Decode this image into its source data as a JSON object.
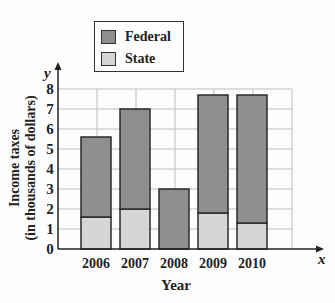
{
  "legend": {
    "items": [
      {
        "label": "Federal",
        "color": "#8f8f8f"
      },
      {
        "label": "State",
        "color": "#d6d6d6"
      }
    ]
  },
  "axes": {
    "y_symbol": "y",
    "x_symbol": "x",
    "ylabel_line1": "Income taxes",
    "ylabel_line2": "(in thousands of dollars)",
    "xlabel": "Year",
    "y_ticks": [
      "0",
      "1",
      "2",
      "3",
      "4",
      "5",
      "6",
      "7",
      "8"
    ]
  },
  "chart_data": {
    "type": "bar",
    "stacked": true,
    "title": "",
    "xlabel": "Year",
    "ylabel": "Income taxes (in thousands of dollars)",
    "categories": [
      "2006",
      "2007",
      "2008",
      "2009",
      "2010"
    ],
    "series": [
      {
        "name": "State",
        "color": "#d6d6d6",
        "values": [
          1.6,
          2.0,
          0.0,
          1.8,
          1.3
        ]
      },
      {
        "name": "Federal",
        "color": "#8f8f8f",
        "values": [
          4.0,
          5.0,
          3.0,
          5.9,
          6.4
        ]
      }
    ],
    "totals": [
      5.6,
      7.0,
      3.0,
      7.7,
      7.7
    ],
    "ylim": [
      0,
      8
    ],
    "y_ticks": [
      0,
      1,
      2,
      3,
      4,
      5,
      6,
      7,
      8
    ],
    "grid": true,
    "legend_position": "top-left, above plot"
  }
}
